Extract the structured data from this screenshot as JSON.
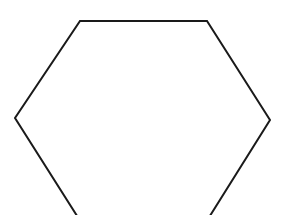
{
  "diagram": {
    "shape": "hexagon",
    "fill": "#ffffff",
    "stroke": "#1a1a1a",
    "stroke_width": 2,
    "vertices": [
      [
        80,
        21
      ],
      [
        207,
        21
      ],
      [
        270,
        120
      ],
      [
        208,
        219
      ],
      [
        79,
        219
      ],
      [
        15,
        118
      ]
    ]
  }
}
